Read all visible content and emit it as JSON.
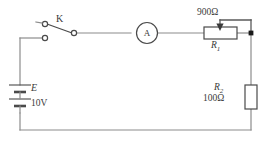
{
  "figure": {
    "type": "electrical-circuit-schematic",
    "width": 271,
    "height": 142
  },
  "components": {
    "battery": {
      "name": "battery",
      "symbol_label": "E",
      "voltage_label": "10V",
      "cells": 2
    },
    "switch": {
      "name": "switch",
      "label": "K",
      "state": "open"
    },
    "ammeter": {
      "name": "ammeter",
      "label": "A"
    },
    "r1": {
      "name": "potentiometer",
      "label": "R",
      "subscript": "1",
      "value_label": "900Ω"
    },
    "r2": {
      "name": "resistor",
      "label": "R",
      "subscript": "2",
      "value_label": "100Ω"
    }
  },
  "colors": {
    "wire": "#8c8c8c",
    "component_stroke": "#4a4a4a",
    "node": "#1a1a1a",
    "text": "#3a3a3a",
    "background": "#ffffff"
  }
}
